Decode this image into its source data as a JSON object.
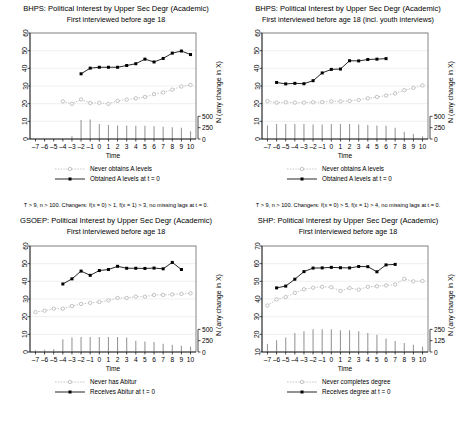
{
  "figure": {
    "panel_count": 4,
    "background": "#ffffff",
    "ink": "#000000",
    "light_ink": "#b4b4b4",
    "grid_color": "#e6e6e6"
  },
  "panels": [
    {
      "id": "bhps-main",
      "title": "BHPS: Political Interest by Upper Sec Degr (Academic)",
      "subtitle": "First interviewed before age 18",
      "note": "T > 9, n > 100. Changers: f(x = 0) > 1, f(x = 1) > 3, no missing lags at t = 0.",
      "legend": [
        {
          "key": "never",
          "label": "Never obtains A levels",
          "style": "dotted-open"
        },
        {
          "key": "changer",
          "label": "Obtained A levels at t = 0",
          "style": "solid-filled"
        }
      ],
      "chart_data": {
        "type": "line",
        "title": "BHPS: Political Interest by Upper Sec Degr (Academic)",
        "subtitle": "First interviewed before age 18",
        "xlabel": "Time",
        "ylabel": "",
        "y2label": "N (any change in X)",
        "xlim": [
          -7.6,
          10.6
        ],
        "ylim": [
          0,
          60
        ],
        "yticks": [
          0,
          10,
          20,
          30,
          40,
          50,
          60
        ],
        "y2lim": [
          0,
          1500
        ],
        "y2ticks": [
          0,
          250,
          500
        ],
        "y2ticklabels": [
          "0",
          "250",
          "500"
        ],
        "x": [
          -7,
          -6,
          -5,
          -4,
          -3,
          -2,
          -1,
          0,
          1,
          2,
          3,
          4,
          5,
          6,
          7,
          8,
          9,
          10
        ],
        "xticklabels": [
          "-7",
          "-6",
          "-5",
          "-4",
          "-3",
          "-2",
          "-1",
          "0",
          "1",
          "2",
          "3",
          "4",
          "5",
          "6",
          "7",
          "8",
          "9",
          "10"
        ],
        "grid": "horizontal",
        "legend_position": "below",
        "series": [
          {
            "name": "Never obtains A levels",
            "style": "dotted-open",
            "x": [
              -7,
              -6,
              -5,
              -4,
              -3,
              -2,
              -1,
              0,
              1,
              2,
              3,
              4,
              5,
              6,
              7,
              8,
              9,
              10
            ],
            "values": [
              null,
              null,
              null,
              21.3,
              19.9,
              22.4,
              20.4,
              20.5,
              19.9,
              21.6,
              22.3,
              23.0,
              23.8,
              25.4,
              26.4,
              27.9,
              29.7,
              30.6
            ]
          },
          {
            "name": "Obtained A levels at t = 0",
            "style": "solid-filled",
            "x": [
              -7,
              -6,
              -5,
              -4,
              -3,
              -2,
              -1,
              0,
              1,
              2,
              3,
              4,
              5,
              6,
              7,
              8,
              9,
              10
            ],
            "values": [
              null,
              null,
              null,
              null,
              null,
              36.9,
              40.1,
              40.6,
              40.6,
              40.6,
              41.6,
              42.6,
              45.2,
              43.6,
              45.6,
              48.6,
              49.8,
              47.8
            ]
          }
        ],
        "bars": {
          "name": "N (any change in X)",
          "x": [
            -7,
            -6,
            -5,
            -4,
            -3,
            -2,
            -1,
            0,
            1,
            2,
            3,
            4,
            5,
            6,
            7,
            8,
            9,
            10
          ],
          "values": [
            0,
            0,
            0,
            0,
            60,
            420,
            430,
            330,
            310,
            300,
            300,
            290,
            290,
            280,
            270,
            260,
            250,
            170
          ]
        }
      }
    },
    {
      "id": "bhps-youth",
      "title": "BHPS: Political Interest by Upper Sec Degr (Academic)",
      "subtitle": "First interviewed before age 18 (incl. youth interviews)",
      "note": "T > 9, n > 100. Changers: f(x = 0) > 5, f(x = 1) > 4, no missing lags at t = 0.",
      "legend": [
        {
          "key": "never",
          "label": "Never obtains A levels",
          "style": "dotted-open"
        },
        {
          "key": "changer",
          "label": "Obtained A levels at t = 0",
          "style": "solid-filled"
        }
      ],
      "chart_data": {
        "type": "line",
        "title": "BHPS: Political Interest by Upper Sec Degr (Academic)",
        "subtitle": "First interviewed before age 18 (incl. youth interviews)",
        "xlabel": "Time",
        "ylabel": "",
        "y2label": "N (any change in X)",
        "xlim": [
          -7.6,
          10.6
        ],
        "ylim": [
          0,
          60
        ],
        "yticks": [
          0,
          10,
          20,
          30,
          40,
          50,
          60
        ],
        "y2lim": [
          0,
          1500
        ],
        "y2ticks": [
          0,
          250,
          500
        ],
        "y2ticklabels": [
          "0",
          "250",
          "500"
        ],
        "x": [
          -7,
          -6,
          -5,
          -4,
          -3,
          -2,
          -1,
          0,
          1,
          2,
          3,
          4,
          5,
          6,
          7,
          8,
          9,
          10
        ],
        "xticklabels": [
          "-7",
          "-6",
          "-5",
          "-4",
          "-3",
          "-2",
          "-1",
          "0",
          "1",
          "2",
          "3",
          "4",
          "5",
          "6",
          "7",
          "8",
          "9",
          "10"
        ],
        "grid": "horizontal",
        "legend_position": "below",
        "series": [
          {
            "name": "Never obtains A levels",
            "style": "dotted-open",
            "x": [
              -7,
              -6,
              -5,
              -4,
              -3,
              -2,
              -1,
              0,
              1,
              2,
              3,
              4,
              5,
              6,
              7,
              8,
              9,
              10
            ],
            "values": [
              21.4,
              20.6,
              20.8,
              20.6,
              20.6,
              20.8,
              20.9,
              21.3,
              21.3,
              21.6,
              22.1,
              23.0,
              23.8,
              24.6,
              25.8,
              27.6,
              28.9,
              30.3
            ]
          },
          {
            "name": "Obtained A levels at t = 0",
            "style": "solid-filled",
            "x": [
              -7,
              -6,
              -5,
              -4,
              -3,
              -2,
              -1,
              0,
              1,
              2,
              3,
              4,
              5,
              6,
              7,
              8,
              9,
              10
            ],
            "values": [
              null,
              32.0,
              31.2,
              31.5,
              31.3,
              33.0,
              37.4,
              39.4,
              39.6,
              44.3,
              44.2,
              45.0,
              45.2,
              45.5,
              null,
              null,
              null,
              null
            ]
          }
        ],
        "bars": {
          "name": "N (any change in X)",
          "x": [
            -7,
            -6,
            -5,
            -4,
            -3,
            -2,
            -1,
            0,
            1,
            2,
            3,
            4,
            5,
            6,
            7,
            8,
            9,
            10
          ],
          "values": [
            300,
            330,
            330,
            330,
            330,
            320,
            320,
            330,
            330,
            330,
            320,
            310,
            300,
            290,
            250,
            160,
            110,
            60
          ]
        }
      }
    },
    {
      "id": "gsoep",
      "title": "GSOEP: Political Interest by Upper Sec Degr (Academic)",
      "subtitle": "First interviewed before age 18",
      "note": "",
      "legend": [
        {
          "key": "never",
          "label": "Never has Abitur",
          "style": "dotted-open"
        },
        {
          "key": "changer",
          "label": "Receives Abitur at t = 0",
          "style": "solid-filled"
        }
      ],
      "chart_data": {
        "type": "line",
        "title": "GSOEP: Political Interest by Upper Sec Degr (Academic)",
        "subtitle": "First interviewed before age 18",
        "xlabel": "Time",
        "ylabel": "",
        "y2label": "N (any change in X)",
        "xlim": [
          -7.6,
          10.6
        ],
        "ylim": [
          0,
          60
        ],
        "yticks": [
          0,
          10,
          20,
          30,
          40,
          50,
          60
        ],
        "y2lim": [
          0,
          1500
        ],
        "y2ticks": [
          0,
          250,
          500
        ],
        "y2ticklabels": [
          "0",
          "250",
          "500"
        ],
        "x": [
          -7,
          -6,
          -5,
          -4,
          -3,
          -2,
          -1,
          0,
          1,
          2,
          3,
          4,
          5,
          6,
          7,
          8,
          9,
          10
        ],
        "xticklabels": [
          "-7",
          "-6",
          "-5",
          "-4",
          "-3",
          "-2",
          "-1",
          "0",
          "1",
          "2",
          "3",
          "4",
          "5",
          "6",
          "7",
          "8",
          "9",
          "10"
        ],
        "grid": "horizontal",
        "legend_position": "below",
        "series": [
          {
            "name": "Never has Abitur",
            "style": "dotted-open",
            "x": [
              -7,
              -6,
              -5,
              -4,
              -3,
              -2,
              -1,
              0,
              1,
              2,
              3,
              4,
              5,
              6,
              7,
              8,
              9,
              10
            ],
            "values": [
              22.6,
              23.4,
              24.5,
              24.5,
              26.0,
              27.2,
              27.8,
              28.3,
              29.2,
              30.6,
              30.6,
              31.4,
              31.3,
              32.3,
              32.3,
              32.6,
              32.9,
              33.2
            ]
          },
          {
            "name": "Receives Abitur at t = 0",
            "style": "solid-filled",
            "x": [
              -7,
              -6,
              -5,
              -4,
              -3,
              -2,
              -1,
              0,
              1,
              2,
              3,
              4,
              5,
              6,
              7,
              8,
              9,
              10
            ],
            "values": [
              null,
              null,
              null,
              38.5,
              41.4,
              45.8,
              43.4,
              46.1,
              46.7,
              48.5,
              47.4,
              47.4,
              47.3,
              47.5,
              47.1,
              50.7,
              46.7,
              null
            ]
          }
        ],
        "bars": {
          "name": "N (any change in X)",
          "x": [
            -7,
            -6,
            -5,
            -4,
            -3,
            -2,
            -1,
            0,
            1,
            2,
            3,
            4,
            5,
            6,
            7,
            8,
            9,
            10
          ],
          "values": [
            40,
            50,
            60,
            280,
            320,
            330,
            330,
            330,
            330,
            330,
            320,
            250,
            230,
            220,
            180,
            160,
            140,
            120
          ]
        }
      }
    },
    {
      "id": "shp",
      "title": "SHP: Political Interest by Upper Sec Degr (Academic)",
      "subtitle": "First interviewed before age 18",
      "note": "",
      "legend": [
        {
          "key": "never",
          "label": "Never completes degree",
          "style": "dotted-open"
        },
        {
          "key": "changer",
          "label": "Receives degree at t = 0",
          "style": "solid-filled"
        }
      ],
      "chart_data": {
        "type": "line",
        "title": "SHP: Political Interest by Upper Sec Degr (Academic)",
        "subtitle": "First interviewed before age 18",
        "xlabel": "Time",
        "ylabel": "",
        "y2label": "N (any change in X)",
        "xlim": [
          -7.6,
          10.6
        ],
        "ylim": [
          10,
          70
        ],
        "yticks": [
          10,
          20,
          30,
          40,
          50,
          60,
          70
        ],
        "y2lim": [
          0,
          750
        ],
        "y2ticks": [
          0,
          125,
          250
        ],
        "y2ticklabels": [
          "0",
          "125",
          "250"
        ],
        "x": [
          -7,
          -6,
          -5,
          -4,
          -3,
          -2,
          -1,
          0,
          1,
          2,
          3,
          4,
          5,
          6,
          7,
          8,
          9,
          10
        ],
        "xticklabels": [
          "-7",
          "-6",
          "-5",
          "-4",
          "-3",
          "-2",
          "-1",
          "0",
          "1",
          "2",
          "3",
          "4",
          "5",
          "6",
          "7",
          "8",
          "9",
          "10"
        ],
        "grid": "horizontal",
        "legend_position": "below",
        "series": [
          {
            "name": "Never completes degree",
            "style": "dotted-open",
            "x": [
              -7,
              -6,
              -5,
              -4,
              -3,
              -2,
              -1,
              0,
              1,
              2,
              3,
              4,
              5,
              6,
              7,
              8,
              9,
              10
            ],
            "values": [
              36.3,
              39.8,
              41.1,
              43.5,
              45.5,
              46.4,
              46.9,
              46.7,
              44.6,
              46.2,
              45.3,
              46.9,
              47.2,
              47.7,
              48.2,
              51.4,
              50.0,
              50.2
            ]
          },
          {
            "name": "Receives degree at t = 0",
            "style": "solid-filled",
            "x": [
              -7,
              -6,
              -5,
              -4,
              -3,
              -2,
              -1,
              0,
              1,
              2,
              3,
              4,
              5,
              6,
              7,
              8,
              9,
              10
            ],
            "values": [
              null,
              46.3,
              47.3,
              51.2,
              55.5,
              57.5,
              57.6,
              57.9,
              57.7,
              57.6,
              58.4,
              58.3,
              55.4,
              59.3,
              59.6,
              null,
              null,
              null
            ]
          }
        ],
        "bars": {
          "name": "N (any change in X)",
          "x": [
            -7,
            -6,
            -5,
            -4,
            -3,
            -2,
            -1,
            0,
            1,
            2,
            3,
            4,
            5,
            6,
            7,
            8,
            9,
            10
          ],
          "values": [
            90,
            130,
            160,
            210,
            230,
            250,
            250,
            250,
            240,
            240,
            230,
            210,
            190,
            150,
            120,
            100,
            80,
            60
          ]
        }
      }
    }
  ]
}
